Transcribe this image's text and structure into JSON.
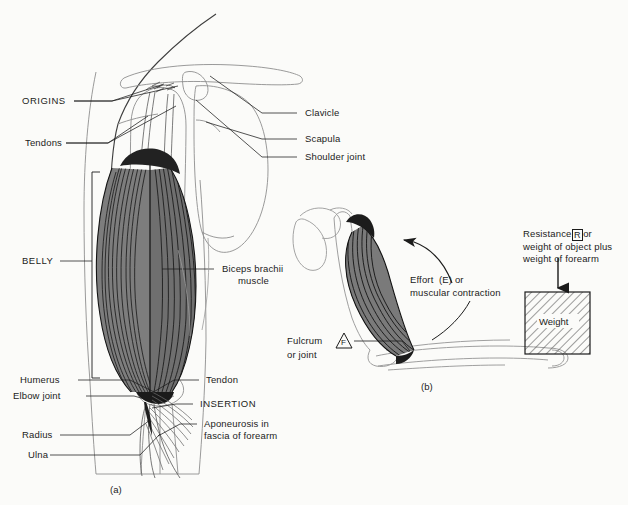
{
  "figure": {
    "background_color": "#fbfbf9",
    "ink_color": "#1b1b1b",
    "muscle_fill": "#6e6e6e",
    "bone_outline": "#8d8d8d"
  },
  "panel_a": {
    "caption": "(a)",
    "labels": {
      "origins": "ORIGINS",
      "tendons": "Tendons",
      "belly": "BELLY",
      "humerus": "Humerus",
      "elbow_joint": "Elbow joint",
      "radius": "Radius",
      "ulna": "Ulna",
      "clavicle": "Clavicle",
      "scapula": "Scapula",
      "shoulder_joint": "Shoulder joint",
      "biceps_line1": "Biceps brachii",
      "biceps_line2": "muscle",
      "tendon": "Tendon",
      "insertion": "INSERTION",
      "aponeurosis_line1": "Aponeurosis in",
      "aponeurosis_line2": "fascia of forearm"
    }
  },
  "panel_b": {
    "caption": "(b)",
    "labels": {
      "effort_line1": "Effort  (E) or",
      "effort_line2": "muscular contraction",
      "fulcrum_line1": "Fulcrum",
      "fulcrum_line2": "or joint",
      "fulcrum_symbol": "F",
      "resistance_prefix": "Resistance",
      "resistance_symbol": "R",
      "resistance_suffix": "or",
      "resistance_line2": "weight of object plus",
      "resistance_line3": "weight of forearm",
      "weight_box": "Weight"
    }
  }
}
